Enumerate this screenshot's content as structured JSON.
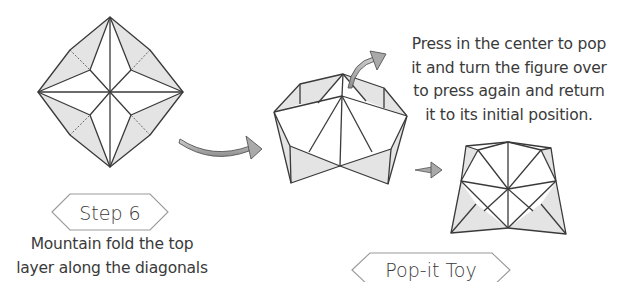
{
  "step": {
    "label": "Step 6",
    "instruction_lines": [
      "Mountain fold the top",
      "layer along the diagonals"
    ]
  },
  "result": {
    "label": "Pop-it Toy",
    "instruction_lines": [
      "Press in the center to pop",
      "it and turn the figure over",
      "to press again and return",
      "it to its initial position."
    ]
  },
  "figures": [
    {
      "name": "step-6-diagram",
      "description": "square base with diagonal mountain folds"
    },
    {
      "name": "pop-it-popped-view",
      "description": "folded figure popped up"
    },
    {
      "name": "pop-it-flat-view",
      "description": "folded figure pressed"
    }
  ],
  "arrows": [
    {
      "name": "step-to-result-arrow",
      "direction": "right"
    },
    {
      "name": "turn-over-arrow",
      "direction": "up-right"
    },
    {
      "name": "press-arrow",
      "direction": "right"
    }
  ],
  "colors": {
    "line": "#3a3a3a",
    "shade": "#e4e4e4",
    "arrow_fill": "#a9a9a9",
    "background": "#ffffff"
  }
}
